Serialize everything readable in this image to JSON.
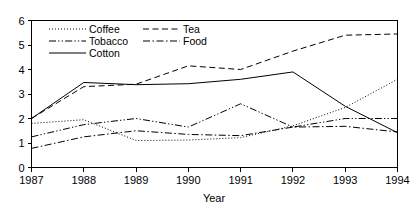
{
  "chart_data": {
    "type": "line",
    "title": "",
    "xlabel": "Year",
    "ylabel": "",
    "categories": [
      "1987",
      "1988",
      "1989",
      "1990",
      "1991",
      "1992",
      "1993",
      "1994"
    ],
    "x": [
      1987,
      1988,
      1989,
      1990,
      1991,
      1992,
      1993,
      1994
    ],
    "xlim": [
      1987,
      1994
    ],
    "ylim": [
      0,
      6
    ],
    "y_ticks": [
      0,
      1,
      2,
      3,
      4,
      5,
      6
    ],
    "y_tick_labels": [
      "0",
      "1",
      "2",
      "3",
      "4",
      "5",
      "6"
    ],
    "x_tick_labels": [
      "1987",
      "1988",
      "1989",
      "1990",
      "1991",
      "1992",
      "1993",
      "1994"
    ],
    "grid": false,
    "legend_position": "top-left-inside",
    "series": [
      {
        "name": "Coffee",
        "line_style": "dotted",
        "values": [
          1.8,
          1.95,
          1.1,
          1.12,
          1.22,
          1.7,
          2.45,
          3.6
        ]
      },
      {
        "name": "Tea",
        "line_style": "dashed",
        "values": [
          2.0,
          3.3,
          3.4,
          4.15,
          4.0,
          4.75,
          5.4,
          5.45
        ]
      },
      {
        "name": "Tobacco",
        "line_style": "dash-dot-dot",
        "values": [
          1.25,
          1.75,
          2.0,
          1.65,
          2.6,
          1.65,
          2.0,
          2.0
        ]
      },
      {
        "name": "Food",
        "line_style": "dash-dot",
        "values": [
          0.78,
          1.25,
          1.5,
          1.35,
          1.3,
          1.65,
          1.68,
          1.45
        ]
      },
      {
        "name": "Cotton",
        "line_style": "solid",
        "values": [
          2.0,
          3.47,
          3.38,
          3.42,
          3.6,
          3.9,
          2.5,
          1.42
        ]
      }
    ],
    "legend_entries": [
      {
        "label": "Coffee",
        "line_style": "dotted"
      },
      {
        "label": "Tea",
        "line_style": "dashed"
      },
      {
        "label": "Tobacco",
        "line_style": "dash-dot-dot"
      },
      {
        "label": "Food",
        "line_style": "dash-dot"
      },
      {
        "label": "Cotton",
        "line_style": "solid"
      }
    ],
    "colors": {
      "line": "#000000",
      "axis": "#000000",
      "background": "#ffffff",
      "text": "#000000"
    }
  }
}
